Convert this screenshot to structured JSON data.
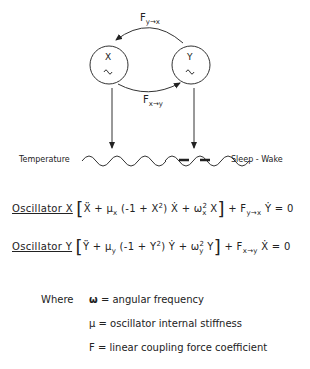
{
  "diagram": {
    "nodes": [
      {
        "id": "X",
        "label": "X",
        "symbol": "~"
      },
      {
        "id": "Y",
        "label": "Y",
        "symbol": "~"
      }
    ],
    "coupling": {
      "top": {
        "label": "F",
        "sub": "y→x"
      },
      "bottom": {
        "label": "F",
        "sub": "x→y"
      }
    },
    "outputs": [
      {
        "label": "Temperature"
      },
      {
        "label": "Sleep - Wake"
      }
    ]
  },
  "equations": [
    {
      "name": "Oscillator  X",
      "body": "Ẍ + μ",
      "sub1": "x",
      "mid": " (-1 + X",
      "sup": "2",
      "mid2": ") Ẋ + ω",
      "sub2": "x",
      "sup2": "2",
      "end": " X",
      "tail": " + F",
      "tailsub": "y→x",
      "tailend": " Ẏ = 0"
    },
    {
      "name": "Oscillator  Y",
      "body": "Ÿ + μ",
      "sub1": "y",
      "mid": " (-1 + Y",
      "sup": "2",
      "mid2": ") Ẏ + ω",
      "sub2": "y",
      "sup2": "2",
      "end": " Y",
      "tail": " + F",
      "tailsub": "x→y",
      "tailend": " Ẋ = 0"
    }
  ],
  "definitions": {
    "where": "Where",
    "items": [
      {
        "symbol": "ω",
        "text": "= angular frequency"
      },
      {
        "symbol": "μ",
        "text": "= oscillator internal stiffness"
      },
      {
        "symbol": "F",
        "text": "= linear coupling force coefficient"
      }
    ]
  }
}
